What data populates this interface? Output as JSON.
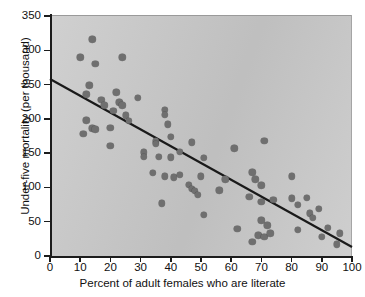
{
  "chart_data": {
    "type": "scatter",
    "title": "",
    "xlabel": "Percent of adult females who are literate",
    "ylabel": "Under-five mortality (per thousand)",
    "xlim": [
      0,
      100
    ],
    "ylim": [
      0,
      350
    ],
    "xticks": [
      0,
      10,
      20,
      30,
      40,
      50,
      60,
      70,
      80,
      90,
      100
    ],
    "yticks": [
      0,
      50,
      100,
      150,
      200,
      250,
      300,
      350
    ],
    "grid": false,
    "legend": "none",
    "point_color": "#6f6f6f",
    "plot_background": "#c9c9c9",
    "trendline": {
      "type": "linear-regression",
      "color": "#1a1a1a",
      "x_start": 0,
      "y_start": 258,
      "x_end": 100,
      "y_end": 13
    },
    "points": [
      [
        10,
        290
      ],
      [
        11,
        178
      ],
      [
        12,
        236
      ],
      [
        12,
        198
      ],
      [
        13,
        249
      ],
      [
        14,
        316
      ],
      [
        14,
        186
      ],
      [
        15,
        280
      ],
      [
        15,
        185
      ],
      [
        17,
        228
      ],
      [
        18,
        220
      ],
      [
        20,
        161
      ],
      [
        20,
        187
      ],
      [
        21,
        212
      ],
      [
        22,
        239
      ],
      [
        23,
        224
      ],
      [
        24,
        290
      ],
      [
        24,
        220
      ],
      [
        25,
        205
      ],
      [
        26,
        197
      ],
      [
        29,
        231
      ],
      [
        31,
        151
      ],
      [
        31,
        145
      ],
      [
        34,
        121
      ],
      [
        35,
        167
      ],
      [
        35,
        164
      ],
      [
        36,
        145
      ],
      [
        37,
        77
      ],
      [
        38,
        213
      ],
      [
        38,
        206
      ],
      [
        38,
        116
      ],
      [
        39,
        192
      ],
      [
        40,
        174
      ],
      [
        40,
        144
      ],
      [
        41,
        115
      ],
      [
        43,
        152
      ],
      [
        43,
        118
      ],
      [
        46,
        104
      ],
      [
        47,
        98
      ],
      [
        47,
        166
      ],
      [
        48,
        95
      ],
      [
        49,
        89
      ],
      [
        50,
        116
      ],
      [
        51,
        143
      ],
      [
        51,
        60
      ],
      [
        56,
        96
      ],
      [
        58,
        112
      ],
      [
        61,
        157
      ],
      [
        62,
        40
      ],
      [
        66,
        86
      ],
      [
        67,
        21
      ],
      [
        67,
        122
      ],
      [
        68,
        112
      ],
      [
        69,
        30
      ],
      [
        70,
        52
      ],
      [
        70,
        79
      ],
      [
        70,
        103
      ],
      [
        71,
        28
      ],
      [
        71,
        168
      ],
      [
        72,
        45
      ],
      [
        73,
        33
      ],
      [
        74,
        82
      ],
      [
        80,
        116
      ],
      [
        80,
        84
      ],
      [
        82,
        75
      ],
      [
        82,
        38
      ],
      [
        85,
        85
      ],
      [
        86,
        62
      ],
      [
        87,
        56
      ],
      [
        89,
        69
      ],
      [
        90,
        28
      ],
      [
        92,
        41
      ],
      [
        95,
        17
      ],
      [
        96,
        33
      ]
    ]
  }
}
